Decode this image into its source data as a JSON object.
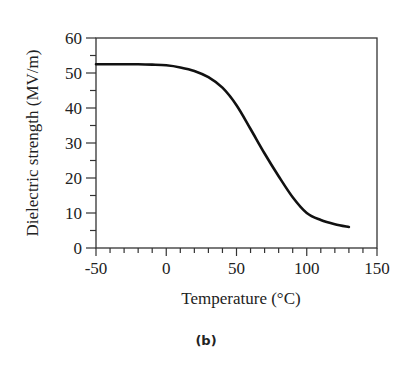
{
  "caption": "(b)",
  "chart_data": {
    "type": "line",
    "title": "",
    "xlabel": "Temperature (°C)",
    "ylabel": "Dielectric strength (MV/m)",
    "xlim": [
      -50,
      150
    ],
    "ylim": [
      0,
      60
    ],
    "xticks": [
      -50,
      0,
      50,
      100,
      150
    ],
    "yticks": [
      0,
      10,
      20,
      30,
      40,
      50,
      60
    ],
    "x_minor_step": 10,
    "y_minor_step": 5,
    "grid": false,
    "legend": null,
    "series": [
      {
        "name": "Dielectric strength",
        "x": [
          -50,
          -40,
          -30,
          -20,
          -10,
          0,
          10,
          20,
          30,
          40,
          50,
          60,
          70,
          80,
          90,
          100,
          110,
          120,
          130
        ],
        "y": [
          52.5,
          52.5,
          52.5,
          52.5,
          52.4,
          52.2,
          51.6,
          50.6,
          48.8,
          45.8,
          40.8,
          34.0,
          27.0,
          20.5,
          14.5,
          10.0,
          8.0,
          6.8,
          6.0
        ]
      }
    ]
  }
}
